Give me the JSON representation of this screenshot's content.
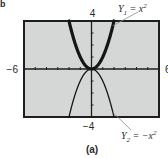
{
  "figure": {
    "corner_label": "b",
    "caption": "(a)"
  },
  "chart_data": {
    "type": "line",
    "title": "",
    "xlabel": "",
    "ylabel": "",
    "xlim": [
      -6,
      6
    ],
    "ylim": [
      -4,
      4
    ],
    "x_tick_step": 1,
    "y_tick_step": 1,
    "grid": false,
    "window_labels": {
      "xmin": "−6",
      "xmax": "6",
      "ymin": "−4",
      "ymax": "4"
    },
    "series": [
      {
        "name": "Y1",
        "equation": "Y1 = x^2",
        "label_main": "Y",
        "label_sub": "1",
        "label_rest": " = x",
        "label_sup": "2",
        "style": "thick",
        "expr": "x^2",
        "label_anchor_x": 1.9
      },
      {
        "name": "Y2",
        "equation": "Y2 = −x^2",
        "label_main": "Y",
        "label_sub": "2",
        "label_rest": " = −x",
        "label_sup": "2",
        "style": "thin",
        "expr": "-x^2",
        "label_anchor_x": 1.9
      }
    ],
    "colors": {
      "screen_bg": "#d5d7d6",
      "frame": "#1e1e1e",
      "curve": "#151515",
      "axis": "#1e1e1e",
      "leader": "#8a8a8a"
    }
  }
}
